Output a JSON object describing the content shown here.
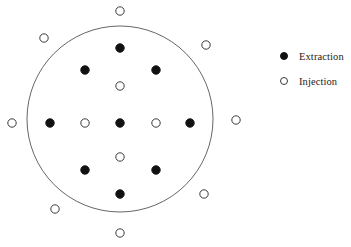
{
  "figure": {
    "title": "",
    "boundary": {
      "shape": "circle",
      "center_x": 120,
      "center_y": 119,
      "radius": 93,
      "stroke_color": "#555555",
      "stroke_width": 0.9,
      "fill": "none"
    },
    "marker_styles": {
      "extraction": {
        "fill": "#111111",
        "stroke": "#111111",
        "radius": 4.2
      },
      "injection": {
        "fill": "#ffffff",
        "stroke": "#3a3a3a",
        "radius": 4.2
      }
    }
  },
  "chart_data": {
    "type": "scatter",
    "title": "",
    "xlabel": "",
    "ylabel": "",
    "grid": false,
    "legend_position": "right",
    "xlim": [
      0,
      351
    ],
    "ylim": [
      247,
      0
    ],
    "annotations": [
      {
        "kind": "circle-boundary",
        "cx": 120,
        "cy": 119,
        "r": 93
      }
    ],
    "series": [
      {
        "name": "Extraction",
        "marker": "filled-circle",
        "color": "#111111",
        "count": 9,
        "points": [
          {
            "x": 120,
            "y": 48,
            "label": "top-center"
          },
          {
            "x": 85,
            "y": 70,
            "label": "upper-left"
          },
          {
            "x": 156,
            "y": 70,
            "label": "upper-right"
          },
          {
            "x": 50,
            "y": 123,
            "label": "mid-left"
          },
          {
            "x": 120,
            "y": 123,
            "label": "center"
          },
          {
            "x": 190,
            "y": 123,
            "label": "mid-right"
          },
          {
            "x": 85,
            "y": 170,
            "label": "lower-left"
          },
          {
            "x": 156,
            "y": 170,
            "label": "lower-right"
          },
          {
            "x": 120,
            "y": 194,
            "label": "bottom-center"
          }
        ]
      },
      {
        "name": "Injection",
        "marker": "open-circle",
        "color": "#ffffff",
        "count": 12,
        "points": [
          {
            "x": 120,
            "y": 86,
            "label": "inner-upper"
          },
          {
            "x": 85,
            "y": 123,
            "label": "inner-left"
          },
          {
            "x": 156,
            "y": 123,
            "label": "inner-right"
          },
          {
            "x": 120,
            "y": 157,
            "label": "inner-lower"
          },
          {
            "x": 120,
            "y": 11,
            "label": "outer-north"
          },
          {
            "x": 44,
            "y": 38,
            "label": "outer-northwest"
          },
          {
            "x": 206,
            "y": 45,
            "label": "outer-northeast"
          },
          {
            "x": 12,
            "y": 123,
            "label": "outer-west"
          },
          {
            "x": 236,
            "y": 120,
            "label": "outer-east"
          },
          {
            "x": 55,
            "y": 209,
            "label": "outer-southwest"
          },
          {
            "x": 204,
            "y": 194,
            "label": "outer-southeast"
          },
          {
            "x": 120,
            "y": 233,
            "label": "outer-south"
          }
        ]
      }
    ]
  },
  "legend": {
    "items": [
      {
        "label": "Extraction",
        "marker": "filled-circle",
        "icon": "filled-circle-icon"
      },
      {
        "label": "Injection",
        "marker": "open-circle",
        "icon": "open-circle-icon"
      }
    ]
  }
}
